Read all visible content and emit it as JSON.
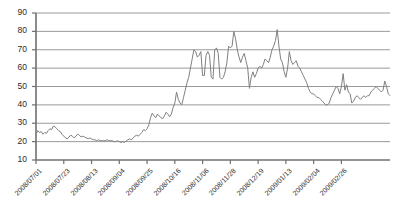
{
  "chart_data": {
    "type": "line",
    "title": "",
    "xlabel": "",
    "ylabel": "",
    "ylim": [
      10,
      90
    ],
    "ytick_values": [
      10,
      20,
      30,
      40,
      50,
      60,
      70,
      80,
      90
    ],
    "ytick_labels": [
      "10",
      "20",
      "30",
      "40",
      "50",
      "60",
      "70",
      "80",
      "90"
    ],
    "xtick_labels": [
      "2008/07/01",
      "2008/07/23",
      "2008/08/13",
      "2008/09/04",
      "2008/09/25",
      "2008/10/16",
      "2008/11/06",
      "2008/11/28",
      "2008/12/19",
      "2009/01/13",
      "2009/02/04",
      "2009/02/26"
    ],
    "xtick_positions": [
      0,
      16,
      32,
      48,
      64,
      80,
      96,
      112,
      128,
      144,
      160,
      176
    ],
    "grid": true,
    "grid_axis": "y",
    "legend": "none",
    "n_points": 177,
    "series": [
      {
        "name": "value",
        "color": "#808080",
        "values": [
          24,
          26,
          25,
          25.5,
          24,
          25,
          24.5,
          26,
          27,
          26.5,
          28.5,
          28,
          27,
          26,
          25.5,
          24,
          23,
          22,
          21.5,
          22.5,
          23.5,
          23,
          22,
          23,
          24,
          23.5,
          22.5,
          23,
          22.5,
          22,
          21.5,
          22,
          21.5,
          21,
          21,
          20.5,
          21,
          20.5,
          20.5,
          20.5,
          20.5,
          21,
          20.5,
          20.5,
          20.5,
          20,
          20,
          20.5,
          20,
          19.5,
          20,
          19.5,
          20.5,
          21,
          21.5,
          21,
          22,
          23,
          23.5,
          23,
          24,
          25,
          26.5,
          26,
          27,
          29,
          33,
          35.5,
          34,
          33,
          35,
          34,
          33,
          32.5,
          34,
          36,
          35,
          33.5,
          35,
          38.5,
          41,
          47,
          43,
          41,
          40,
          44,
          48,
          52,
          55,
          60,
          65,
          70,
          69,
          66,
          67,
          69,
          56,
          56,
          67,
          69,
          67,
          55,
          54,
          70,
          71,
          68,
          55,
          54,
          55,
          58,
          63,
          72,
          71,
          72,
          80,
          76,
          70,
          66,
          63,
          66,
          68,
          64,
          60,
          49,
          55,
          58,
          55,
          57,
          60,
          61,
          60,
          62,
          65,
          64,
          63,
          66,
          70,
          72,
          75,
          81,
          72,
          65,
          63,
          58,
          55,
          60,
          69,
          64,
          62,
          63,
          64,
          61,
          60,
          58,
          56,
          54,
          52,
          49,
          47,
          46,
          46,
          45,
          44,
          44,
          43,
          42,
          41,
          40,
          40,
          41,
          44,
          46,
          48,
          50,
          49,
          46,
          50,
          57,
          48,
          51,
          47,
          46,
          41,
          42,
          44,
          45,
          44,
          43,
          44,
          45,
          44,
          45,
          45,
          47,
          48,
          49,
          50,
          49,
          48,
          47,
          48,
          53,
          50,
          46,
          45
        ]
      }
    ]
  },
  "axis": {
    "y_axis_name": "y-axis",
    "x_axis_name": "x-axis"
  }
}
